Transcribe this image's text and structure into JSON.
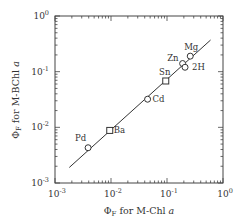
{
  "chart_data": {
    "type": "scatter",
    "title": "",
    "xlabel": "Φ_F for M-Chl a",
    "ylabel": "Φ_F for M-BChl a",
    "xscale": "log",
    "yscale": "log",
    "xlim": [
      0.001,
      1
    ],
    "ylim": [
      0.001,
      1
    ],
    "x_ticks": [
      "10^-3",
      "10^-2",
      "10^-1",
      "10^0"
    ],
    "y_ticks": [
      "10^-3",
      "10^-2",
      "10^-1",
      "10^0"
    ],
    "grid": false,
    "legend": null,
    "points": [
      {
        "label": "Pd",
        "x": 0.0039,
        "y": 0.0043,
        "marker": "circle"
      },
      {
        "label": "Ba",
        "x": 0.0095,
        "y": 0.0088,
        "marker": "square"
      },
      {
        "label": "Cd",
        "x": 0.045,
        "y": 0.032,
        "marker": "circle"
      },
      {
        "label": "Sn",
        "x": 0.095,
        "y": 0.068,
        "marker": "square"
      },
      {
        "label": "Zn",
        "x": 0.19,
        "y": 0.14,
        "marker": "circle"
      },
      {
        "label": "2H",
        "x": 0.21,
        "y": 0.12,
        "marker": "circle"
      },
      {
        "label": "Mg",
        "x": 0.26,
        "y": 0.19,
        "marker": "circle"
      }
    ],
    "fit_line": {
      "x": [
        0.0018,
        0.6
      ],
      "y": [
        0.0019,
        0.37
      ]
    }
  },
  "axes": {
    "x_title_main": "Φ",
    "x_title_sub": "F",
    "x_title_rest": " for M-Chl ",
    "x_title_italic": "a",
    "y_title_main": "Φ",
    "y_title_sub": "F",
    "y_title_rest": " for M-BChl ",
    "y_title_italic": "a"
  }
}
